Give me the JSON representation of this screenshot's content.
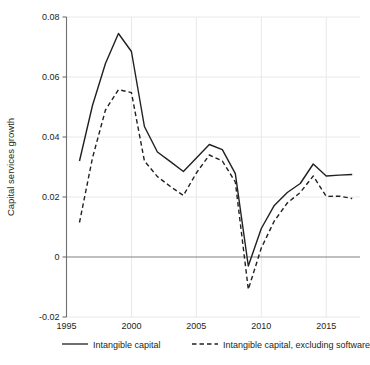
{
  "chart_data": {
    "type": "line",
    "title": "",
    "xlabel": "",
    "ylabel": "Capital services growth",
    "xlim": [
      1995,
      2017.6
    ],
    "ylim": [
      -0.02,
      0.08
    ],
    "xticks": [
      1995,
      2000,
      2005,
      2010,
      2015
    ],
    "xtick_labels": [
      "1995",
      "2000",
      "2005",
      "2010",
      "2015"
    ],
    "yticks": [
      -0.02,
      0,
      0.02,
      0.04,
      0.06,
      0.08
    ],
    "ytick_labels": [
      "-0.02",
      "0",
      "0.02",
      "0.04",
      "0.06",
      "0.08"
    ],
    "grid": true,
    "grid_color": "#e8e8e8",
    "zero_line": true,
    "zero_line_color": "#808080",
    "legend_position": "below",
    "x": [
      1996,
      1997,
      1998,
      1999,
      2000,
      2001,
      2002,
      2003,
      2004,
      2005,
      2006,
      2007,
      2008,
      2009,
      2010,
      2011,
      2012,
      2013,
      2014,
      2015,
      2016,
      2017
    ],
    "series": [
      {
        "name": "Intangible capital",
        "style": "solid",
        "color": "#231f20",
        "values": [
          0.032,
          0.0505,
          0.0645,
          0.0745,
          0.0685,
          0.0435,
          0.035,
          0.0318,
          0.0285,
          0.033,
          0.0375,
          0.0358,
          0.0278,
          -0.003,
          0.0095,
          0.0172,
          0.0215,
          0.0245,
          0.031,
          0.027,
          0.0273,
          0.0275
        ]
      },
      {
        "name": "Intangible capital, excluding software",
        "style": "dashed",
        "color": "#231f20",
        "values": [
          0.0115,
          0.033,
          0.049,
          0.0558,
          0.0548,
          0.032,
          0.0268,
          0.0235,
          0.0205,
          0.028,
          0.034,
          0.032,
          0.025,
          -0.0108,
          0.003,
          0.012,
          0.018,
          0.0215,
          0.027,
          0.0202,
          0.0203,
          0.0195
        ]
      }
    ]
  },
  "legend": {
    "items": [
      {
        "label": "Intangible capital",
        "style": "solid"
      },
      {
        "label": "Intangible capital, excluding software",
        "style": "dashed"
      }
    ]
  }
}
